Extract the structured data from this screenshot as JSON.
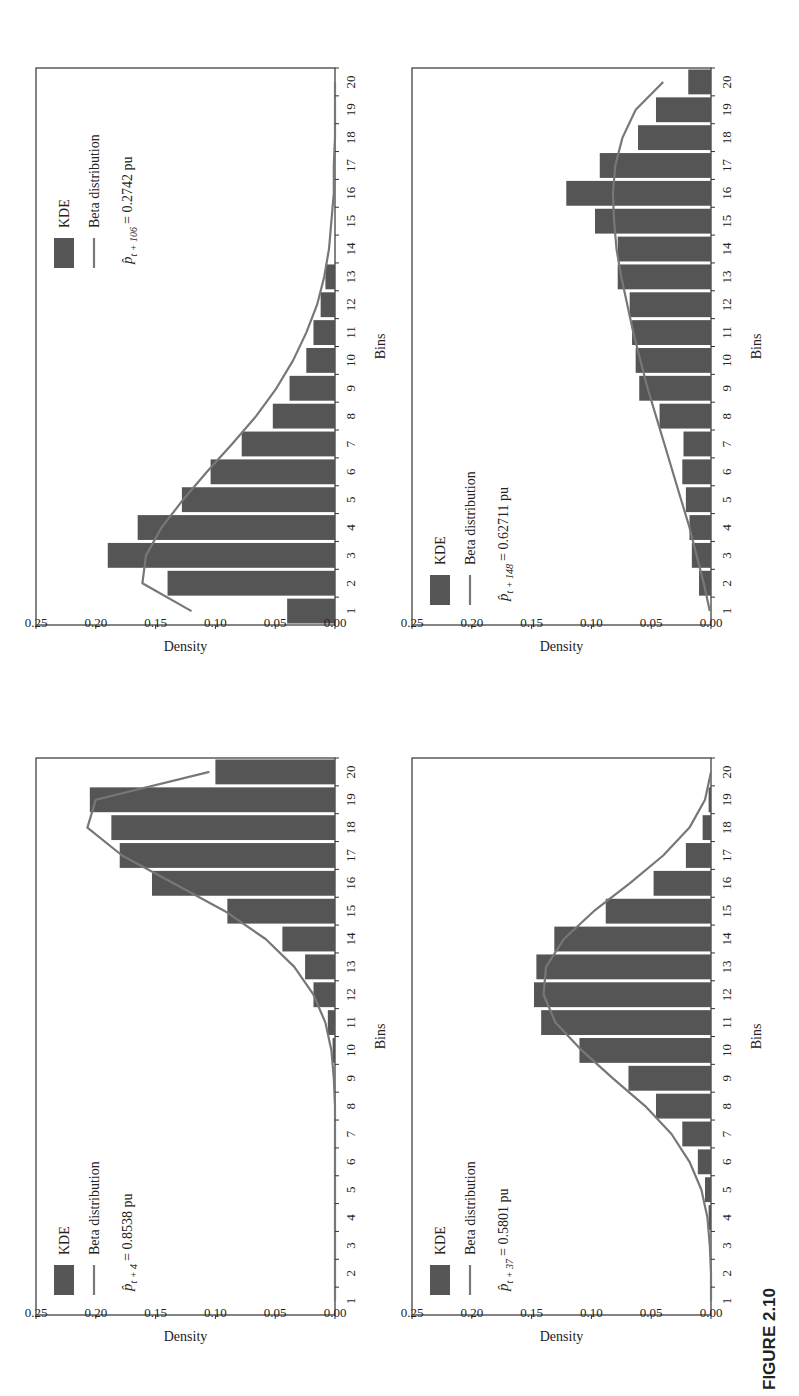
{
  "figure": {
    "label": "FIGURE 2.10"
  },
  "chart_data": [
    {
      "id": "t106",
      "type": "bar",
      "title": "",
      "xlabel": "Bins",
      "ylabel": "Density",
      "ylim": [
        0,
        0.25
      ],
      "yticks": [
        "0.00",
        "0.05",
        "0.10",
        "0.15",
        "0.20",
        "0.25"
      ],
      "categories": [
        "1",
        "2",
        "3",
        "4",
        "5",
        "6",
        "7",
        "8",
        "9",
        "10",
        "11",
        "12",
        "13",
        "14",
        "15",
        "16",
        "17",
        "18",
        "19",
        "20"
      ],
      "legend": {
        "bar": "KDE",
        "line": "Beta distribution",
        "annotation_symbol": "p̂",
        "annotation_sub": "t + 106",
        "annotation_value": "= 0.2742 pu",
        "position": "upper-right"
      },
      "series": [
        {
          "name": "KDE",
          "type": "bar",
          "values": [
            0.04,
            0.14,
            0.19,
            0.165,
            0.128,
            0.104,
            0.078,
            0.052,
            0.038,
            0.024,
            0.018,
            0.012,
            0.008,
            0,
            0,
            0,
            0,
            0,
            0,
            0
          ]
        },
        {
          "name": "Beta distribution",
          "type": "line",
          "values": [
            0.12,
            0.161,
            0.158,
            0.145,
            0.127,
            0.107,
            0.086,
            0.066,
            0.049,
            0.035,
            0.024,
            0.015,
            0.009,
            0.005,
            0.003,
            0.001,
            0.001,
            0,
            0,
            0
          ]
        }
      ]
    },
    {
      "id": "t4",
      "type": "bar",
      "title": "",
      "xlabel": "Bins",
      "ylabel": "Density",
      "ylim": [
        0,
        0.25
      ],
      "yticks": [
        "0.00",
        "0.05",
        "0.10",
        "0.15",
        "0.20",
        "0.25"
      ],
      "categories": [
        "1",
        "2",
        "3",
        "4",
        "5",
        "6",
        "7",
        "8",
        "9",
        "10",
        "11",
        "12",
        "13",
        "14",
        "15",
        "16",
        "17",
        "18",
        "19",
        "20"
      ],
      "legend": {
        "bar": "KDE",
        "line": "Beta distribution",
        "annotation_symbol": "p̂",
        "annotation_sub": "t + 4",
        "annotation_value": "= 0.8538 pu",
        "position": "upper-left"
      },
      "series": [
        {
          "name": "KDE",
          "type": "bar",
          "values": [
            0,
            0,
            0,
            0,
            0,
            0,
            0,
            0,
            0,
            0.002,
            0.006,
            0.018,
            0.025,
            0.044,
            0.09,
            0.153,
            0.18,
            0.187,
            0.205,
            0.1
          ]
        },
        {
          "name": "Beta distribution",
          "type": "line",
          "values": [
            0,
            0,
            0,
            0,
            0,
            0,
            0,
            0,
            0.001,
            0.003,
            0.008,
            0.018,
            0.034,
            0.058,
            0.092,
            0.135,
            0.178,
            0.207,
            0.2,
            0.105
          ]
        }
      ]
    },
    {
      "id": "t148",
      "type": "bar",
      "title": "",
      "xlabel": "Bins",
      "ylabel": "Density",
      "ylim": [
        0,
        0.25
      ],
      "yticks": [
        "0.00",
        "0.05",
        "0.10",
        "0.15",
        "0.20",
        "0.25"
      ],
      "categories": [
        "1",
        "2",
        "3",
        "4",
        "5",
        "6",
        "7",
        "8",
        "9",
        "10",
        "11",
        "12",
        "13",
        "14",
        "15",
        "16",
        "17",
        "18",
        "19",
        "20"
      ],
      "legend": {
        "bar": "KDE",
        "line": "Beta distribution",
        "annotation_symbol": "p̂",
        "annotation_sub": "t + 148",
        "annotation_value": "= 0.62711 pu",
        "position": "upper-left"
      },
      "series": [
        {
          "name": "KDE",
          "type": "bar",
          "values": [
            0,
            0.01,
            0.016,
            0.018,
            0.021,
            0.024,
            0.023,
            0.043,
            0.06,
            0.063,
            0.066,
            0.068,
            0.078,
            0.078,
            0.097,
            0.121,
            0.093,
            0.061,
            0.046,
            0.019
          ]
        },
        {
          "name": "Beta distribution",
          "type": "line",
          "values": [
            0.001,
            0.006,
            0.012,
            0.018,
            0.025,
            0.032,
            0.039,
            0.046,
            0.053,
            0.059,
            0.065,
            0.07,
            0.075,
            0.079,
            0.081,
            0.082,
            0.08,
            0.074,
            0.063,
            0.04
          ]
        }
      ]
    },
    {
      "id": "t37",
      "type": "bar",
      "title": "",
      "xlabel": "Bins",
      "ylabel": "Density",
      "ylim": [
        0,
        0.25
      ],
      "yticks": [
        "0.00",
        "0.05",
        "0.10",
        "0.15",
        "0.20",
        "0.25"
      ],
      "categories": [
        "1",
        "2",
        "3",
        "4",
        "5",
        "6",
        "7",
        "8",
        "9",
        "10",
        "11",
        "12",
        "13",
        "14",
        "15",
        "16",
        "17",
        "18",
        "19",
        "20"
      ],
      "legend": {
        "bar": "KDE",
        "line": "Beta distribution",
        "annotation_symbol": "p̂",
        "annotation_sub": "t + 37",
        "annotation_value": "= 0.5801 pu",
        "position": "upper-left"
      },
      "series": [
        {
          "name": "KDE",
          "type": "bar",
          "values": [
            0,
            0,
            0,
            0.002,
            0.005,
            0.011,
            0.024,
            0.046,
            0.069,
            0.11,
            0.142,
            0.148,
            0.146,
            0.131,
            0.088,
            0.048,
            0.021,
            0.007,
            0.002,
            0
          ]
        },
        {
          "name": "Beta distribution",
          "type": "line",
          "values": [
            0,
            0,
            0.001,
            0.003,
            0.008,
            0.018,
            0.033,
            0.055,
            0.082,
            0.108,
            0.13,
            0.14,
            0.138,
            0.123,
            0.098,
            0.068,
            0.04,
            0.018,
            0.005,
            0
          ]
        }
      ]
    }
  ],
  "colors": {
    "bar": "#555555",
    "line": "#777777",
    "axis": "#333333",
    "background": "#ffffff"
  }
}
